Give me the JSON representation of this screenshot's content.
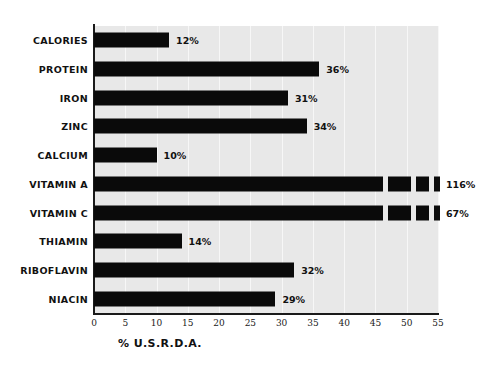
{
  "chart_data": {
    "type": "bar",
    "orientation": "horizontal",
    "title": "",
    "subtitle": "",
    "xlabel": "% U.S.R.D.A.",
    "ylabel": "",
    "xlim": [
      0,
      55
    ],
    "xticks": [
      "0",
      "5",
      "10",
      "15",
      "20",
      "25",
      "30",
      "35",
      "40",
      "45",
      "50",
      "55"
    ],
    "xtick_values": [
      0,
      5,
      10,
      15,
      20,
      25,
      30,
      35,
      40,
      45,
      50,
      55
    ],
    "grid": true,
    "grid_axis": "x",
    "legend": "none",
    "categories": [
      "CALORIES",
      "PROTEIN",
      "IRON",
      "ZINC",
      "CALCIUM",
      "VITAMIN A",
      "VITAMIN C",
      "THIAMIN",
      "RIBOFLAVIN",
      "NIACIN"
    ],
    "values": [
      12,
      36,
      31,
      34,
      10,
      116,
      67,
      14,
      32,
      29
    ],
    "value_labels": [
      "12%",
      "36%",
      "31%",
      "34%",
      "10%",
      "116%",
      "67%",
      "14%",
      "32%",
      "29%"
    ],
    "broken_bars": [
      {
        "category": "VITAMIN A",
        "value": 116,
        "note": "bar exceeds axis max; drawn with break segments"
      },
      {
        "category": "VITAMIN C",
        "value": 67,
        "note": "bar exceeds axis max; drawn with break segments"
      }
    ],
    "colors": {
      "bar": "#0a0a0a",
      "plot_background": "#e8e8e8",
      "figure_background": "#ffffff",
      "axis": "#1a1a1a",
      "gridline": "#f7f7f7",
      "text": "#111111"
    }
  }
}
